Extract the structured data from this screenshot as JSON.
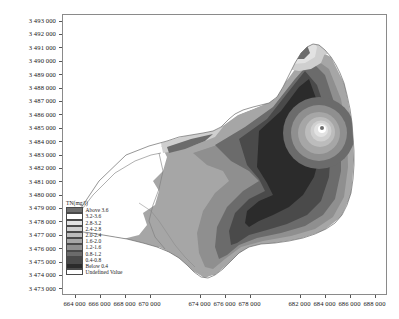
{
  "chart_data": {
    "type": "heatmap",
    "title": "",
    "xlabel": "",
    "ylabel": "",
    "grid": false,
    "legend_position": "inside-lower-left",
    "xlim": [
      663000,
      689000
    ],
    "ylim": [
      3472500,
      3493500
    ],
    "x_tick_labels": [
      "664 000",
      "666 000",
      "668 000",
      "670 000",
      "674 000",
      "676 000",
      "678 000",
      "682 000",
      "684 000",
      "686 000",
      "688 000"
    ],
    "x_tick_values": [
      664000,
      666000,
      668000,
      670000,
      674000,
      676000,
      678000,
      682000,
      684000,
      686000,
      688000
    ],
    "y_tick_labels": [
      "3 473 000",
      "3 474 000",
      "3 475 000",
      "3 476 000",
      "3 477 000",
      "3 478 000",
      "3 479 000",
      "3 480 000",
      "3 481 000",
      "3 482 000",
      "3 483 000",
      "3 484 000",
      "3 485 000",
      "3 486 000",
      "3 487 000",
      "3 488 000",
      "3 489 000",
      "3 490 000",
      "3 491 000",
      "3 492 000",
      "3 493 000"
    ],
    "y_tick_values": [
      3473000,
      3474000,
      3475000,
      3476000,
      3477000,
      3478000,
      3479000,
      3480000,
      3481000,
      3482000,
      3483000,
      3484000,
      3485000,
      3486000,
      3487000,
      3488000,
      3489000,
      3490000,
      3491000,
      3492000,
      3493000
    ],
    "variable": "TN",
    "unit": "mg/l",
    "class_breaks": [
      0.4,
      0.8,
      1.2,
      1.6,
      2.0,
      2.4,
      2.8,
      3.2,
      3.6
    ],
    "classes": [
      {
        "label": "Above 3.6",
        "color": "#6e6e6e",
        "min": 3.6,
        "max": null
      },
      {
        "label": "3.2-3.6",
        "color": "#ffffff",
        "min": 3.2,
        "max": 3.6
      },
      {
        "label": "2.8-3.2",
        "color": "#e2e2e2",
        "min": 2.8,
        "max": 3.2
      },
      {
        "label": "2.4-2.8",
        "color": "#cfcfcf",
        "min": 2.4,
        "max": 2.8
      },
      {
        "label": "2.0-2.4",
        "color": "#bcbcbc",
        "min": 2.0,
        "max": 2.4
      },
      {
        "label": "1.6-2.0",
        "color": "#a6a6a6",
        "min": 1.6,
        "max": 2.0
      },
      {
        "label": "1.2-1.6",
        "color": "#8f8f8f",
        "min": 1.2,
        "max": 1.6
      },
      {
        "label": "0.8-1.2",
        "color": "#6b6b6b",
        "min": 0.8,
        "max": 1.2
      },
      {
        "label": "0.4-0.8",
        "color": "#4a4a4a",
        "min": 0.4,
        "max": 0.8
      },
      {
        "label": "Below 0.4",
        "color": "#2b2b2b",
        "min": null,
        "max": 0.4
      },
      {
        "label": "Undefined Value",
        "color": "#ffffff",
        "min": null,
        "max": null
      }
    ]
  },
  "legend": {
    "title": "TN(mg/l)"
  },
  "axes": {
    "x_label": "",
    "y_label": ""
  }
}
